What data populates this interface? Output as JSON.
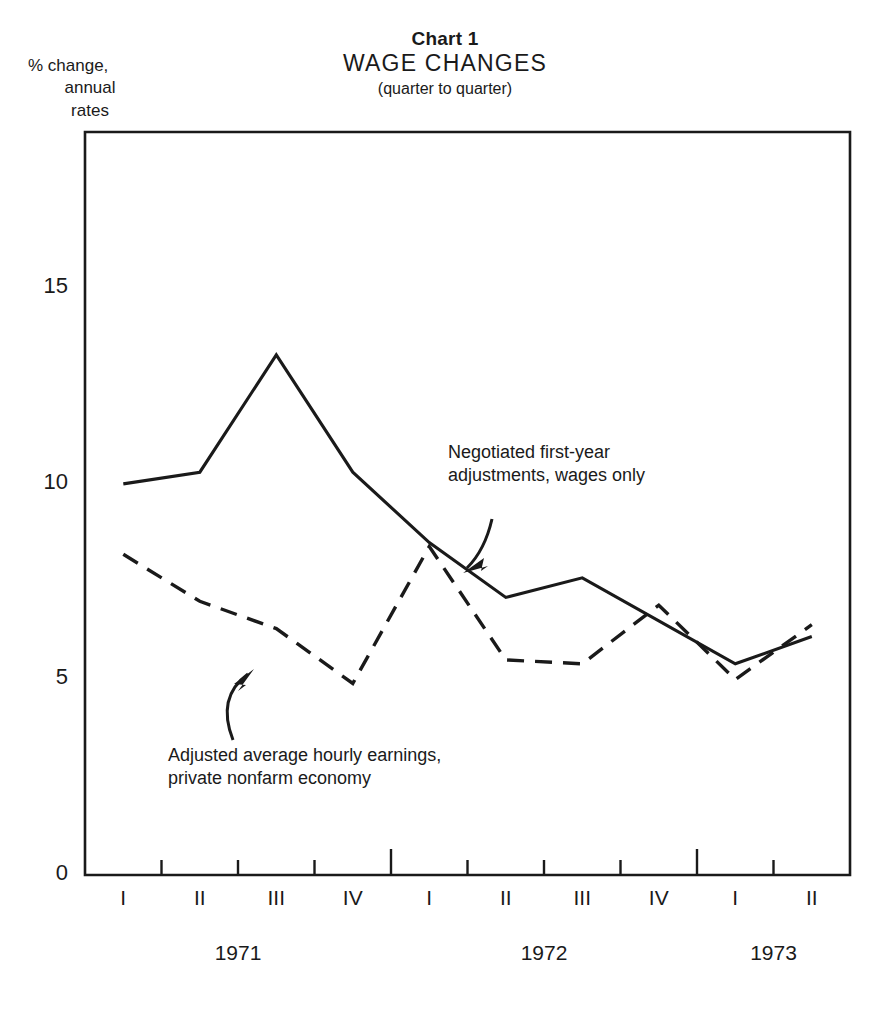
{
  "header": {
    "chart_number": "Chart 1",
    "title": "WAGE  CHANGES",
    "subtitle": "(quarter to quarter)"
  },
  "axis_caption": {
    "line1": "% change,",
    "line2": "annual",
    "line3": "rates"
  },
  "annotations": {
    "negotiated": {
      "line1": "Negotiated first-year",
      "line2": "adjustments, wages only"
    },
    "earnings": {
      "line1": "Adjusted average hourly earnings,",
      "line2": "private nonfarm economy"
    }
  },
  "chart_data": {
    "type": "line",
    "title": "WAGE CHANGES",
    "subtitle": "(quarter to quarter)",
    "xlabel": "",
    "ylabel": "% change, annual rates",
    "ylim": [
      0,
      19
    ],
    "yticks": [
      0,
      5,
      10,
      15
    ],
    "ytick_labels": [
      "0",
      "5",
      "10",
      "15"
    ],
    "grid": false,
    "legend_position": "inline-annotations",
    "x": [
      "1971 I",
      "1971 II",
      "1971 III",
      "1971 IV",
      "1972 I",
      "1972 II",
      "1972 III",
      "1972 IV",
      "1973 I",
      "1973 II"
    ],
    "quarter_labels": [
      "I",
      "II",
      "III",
      "IV",
      "I",
      "II",
      "III",
      "IV",
      "I",
      "II"
    ],
    "year_groups": [
      {
        "label": "1971",
        "quarters": 4
      },
      {
        "label": "1972",
        "quarters": 4
      },
      {
        "label": "1973",
        "quarters": 2
      }
    ],
    "series": [
      {
        "name": "Negotiated first-year adjustments, wages only",
        "style": "solid",
        "values": [
          10.0,
          10.3,
          13.3,
          10.3,
          8.5,
          7.1,
          7.6,
          6.5,
          5.4,
          6.1
        ]
      },
      {
        "name": "Adjusted average hourly earnings, private nonfarm economy",
        "style": "dashed",
        "values": [
          8.2,
          7.0,
          6.3,
          4.9,
          8.4,
          5.5,
          5.4,
          6.9,
          5.0,
          6.4
        ]
      }
    ],
    "colors": {
      "line": "#1a1a1a",
      "background": "#ffffff"
    }
  }
}
